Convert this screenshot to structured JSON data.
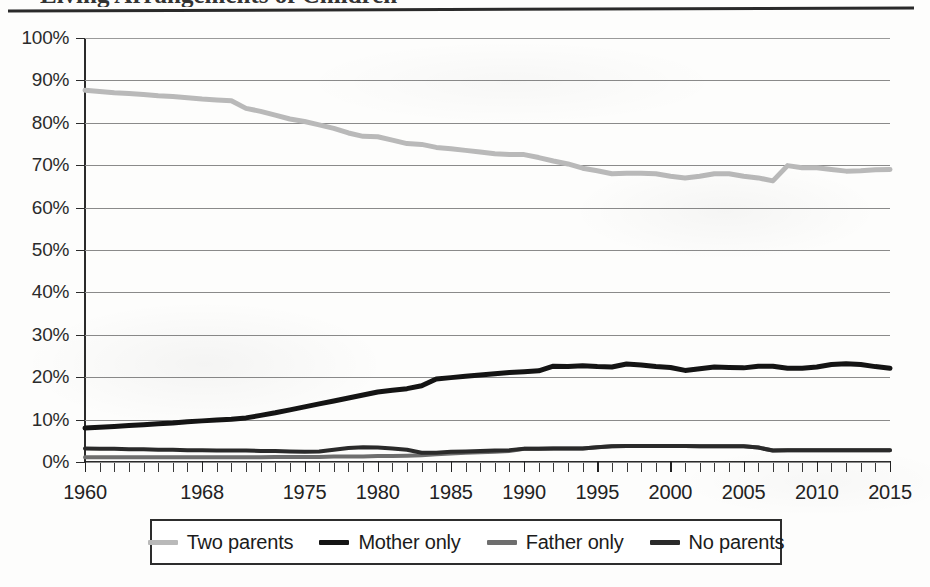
{
  "page": {
    "title_sliver": "Living Arrangements of Children",
    "background_color": "#fdfdfc"
  },
  "legend": {
    "position": "bottom",
    "items": [
      {
        "label": "Two parents",
        "color": "#b9b9b9"
      },
      {
        "label": "Mother only",
        "color": "#141414"
      },
      {
        "label": "Father only",
        "color": "#6e6e6e"
      },
      {
        "label": "No parents",
        "color": "#2a2a2a"
      }
    ]
  },
  "chart_data": {
    "type": "line",
    "title": "Living Arrangements of Children",
    "xlabel": "",
    "ylabel": "",
    "xlim": [
      1960,
      2015
    ],
    "ylim": [
      0,
      100
    ],
    "grid": true,
    "legend_position": "bottom",
    "y_ticks": [
      "0%",
      "10%",
      "20%",
      "30%",
      "40%",
      "50%",
      "60%",
      "70%",
      "80%",
      "90%",
      "100%"
    ],
    "y_tick_values": [
      0,
      10,
      20,
      30,
      40,
      50,
      60,
      70,
      80,
      90,
      100
    ],
    "x_tick_labels": [
      "1960",
      "1968",
      "1975",
      "1980",
      "1985",
      "1990",
      "1995",
      "2000",
      "2005",
      "2010",
      "2015"
    ],
    "x_tick_values": [
      1960,
      1968,
      1975,
      1980,
      1985,
      1990,
      1995,
      2000,
      2005,
      2010,
      2015
    ],
    "x_minor_tick_interval": 1,
    "x": [
      1960,
      1961,
      1962,
      1963,
      1964,
      1965,
      1966,
      1967,
      1968,
      1969,
      1970,
      1971,
      1972,
      1973,
      1974,
      1975,
      1976,
      1977,
      1978,
      1979,
      1980,
      1981,
      1982,
      1983,
      1984,
      1985,
      1986,
      1987,
      1988,
      1989,
      1990,
      1991,
      1992,
      1993,
      1994,
      1995,
      1996,
      1997,
      1998,
      1999,
      2000,
      2001,
      2002,
      2003,
      2004,
      2005,
      2006,
      2007,
      2008,
      2009,
      2010,
      2011,
      2012,
      2013,
      2014,
      2015
    ],
    "series": [
      {
        "name": "Two parents",
        "color": "#b9b9b9",
        "values": [
          87.7,
          87.4,
          87.1,
          86.9,
          86.7,
          86.4,
          86.2,
          85.9,
          85.6,
          85.4,
          85.2,
          83.4,
          82.7,
          81.8,
          80.9,
          80.3,
          79.5,
          78.7,
          77.6,
          76.8,
          76.7,
          75.9,
          75.1,
          74.9,
          74.2,
          73.9,
          73.5,
          73.1,
          72.7,
          72.5,
          72.5,
          71.8,
          71.0,
          70.3,
          69.3,
          68.7,
          68.0,
          68.1,
          68.1,
          68.0,
          67.4,
          67.0,
          67.4,
          68.0,
          68.0,
          67.4,
          67.0,
          66.3,
          69.9,
          69.4,
          69.4,
          69.0,
          68.6,
          68.7,
          68.9,
          69.0
        ]
      },
      {
        "name": "Mother only",
        "color": "#141414",
        "values": [
          8.0,
          8.2,
          8.4,
          8.6,
          8.8,
          9.0,
          9.2,
          9.5,
          9.7,
          9.9,
          10.1,
          10.4,
          11.0,
          11.6,
          12.3,
          13.0,
          13.7,
          14.4,
          15.1,
          15.8,
          16.5,
          16.9,
          17.3,
          18.0,
          19.6,
          19.9,
          20.2,
          20.5,
          20.8,
          21.1,
          21.3,
          21.5,
          22.6,
          22.5,
          22.7,
          22.5,
          22.4,
          23.1,
          22.9,
          22.5,
          22.3,
          21.6,
          22.0,
          22.4,
          22.3,
          22.2,
          22.6,
          22.6,
          22.1,
          22.1,
          22.4,
          23.0,
          23.2,
          23.0,
          22.5,
          22.1
        ]
      },
      {
        "name": "Father only",
        "color": "#6e6e6e",
        "values": [
          1.1,
          1.1,
          1.1,
          1.1,
          1.1,
          1.1,
          1.1,
          1.1,
          1.1,
          1.1,
          1.1,
          1.1,
          1.1,
          1.2,
          1.2,
          1.2,
          1.2,
          1.3,
          1.3,
          1.3,
          1.4,
          1.4,
          1.5,
          1.6,
          1.8,
          2.0,
          2.2,
          2.3,
          2.4,
          2.6,
          3.1,
          3.1,
          3.2,
          3.2,
          3.2,
          3.5,
          3.7,
          3.8,
          3.8,
          3.8,
          3.8,
          3.8,
          3.7,
          3.7,
          3.7,
          3.7,
          3.4,
          2.7,
          2.8,
          2.8,
          2.8,
          2.8,
          2.8,
          2.8,
          2.8,
          2.8
        ]
      },
      {
        "name": "No parents",
        "color": "#2a2a2a",
        "values": [
          3.2,
          3.1,
          3.1,
          3.0,
          3.0,
          2.9,
          2.9,
          2.8,
          2.8,
          2.7,
          2.7,
          2.7,
          2.6,
          2.6,
          2.5,
          2.4,
          2.5,
          2.9,
          3.3,
          3.5,
          3.4,
          3.2,
          2.9,
          2.2,
          2.2,
          2.4,
          2.5,
          2.6,
          2.7,
          2.8,
          3.1,
          3.1,
          3.2,
          3.2,
          3.2,
          3.5,
          3.7,
          3.8,
          3.8,
          3.8,
          3.8,
          3.8,
          3.7,
          3.7,
          3.7,
          3.7,
          3.4,
          2.7,
          2.8,
          2.8,
          2.8,
          2.8,
          2.8,
          2.8,
          2.8,
          2.8
        ]
      }
    ]
  }
}
